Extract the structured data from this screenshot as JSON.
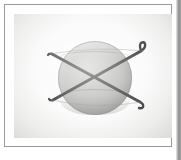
{
  "figure": {
    "title": "Sphere with crossed binding straps",
    "description": "Photographic plate showing a shaded gray sphere crossed by two dark straps forming an X, with hooked ends extending beyond the sphere.",
    "medium": "photographic plate in ruled frame"
  },
  "canvas": {
    "width": 181,
    "height": 160,
    "background_color": "#ffffff"
  },
  "frame": {
    "name": "ruled-border",
    "left": 4,
    "top": 4,
    "width": 168,
    "height": 143,
    "border_color": "#9a9a9c",
    "border_width": 1
  },
  "right_edge_strip": {
    "name": "page-gutter-shadow",
    "width": 5,
    "color_light": "#f2f2f2",
    "color_dark": "#8c8c8c"
  },
  "plate": {
    "name": "photo-plate",
    "left": 9,
    "top": 9,
    "width": 158,
    "height": 124,
    "background_center_color": "#fdfdfd",
    "background_edge_color": "#e4e4e2"
  },
  "sphere": {
    "name": "sphere",
    "center_x": 90,
    "center_y": 73,
    "radius": 37,
    "fill_highlight_color": "#c9c9c7",
    "fill_shadow_color": "#949492",
    "outline_color": "#787876",
    "latitude_arcs": [
      {
        "label": "upper-latitude-arc",
        "y_offset": 10
      },
      {
        "label": "lower-latitude-arc",
        "y_offset": 48
      }
    ]
  },
  "straps": {
    "color": "#2b2b2b",
    "width": 3.0,
    "items": [
      {
        "name": "strap-top-left-to-bottom-right",
        "start_x": 47,
        "start_y": 49,
        "end_x": 134,
        "end_y": 96,
        "hook_end": "bottom-right"
      },
      {
        "name": "strap-top-right-to-bottom-left",
        "start_x": 135,
        "start_y": 46,
        "end_x": 48,
        "end_y": 95,
        "hook_end": "top-right"
      }
    ],
    "crossing_point": {
      "x": 91,
      "y": 72
    }
  },
  "hooks": [
    {
      "name": "hook-top-left",
      "x": 47,
      "y": 49
    },
    {
      "name": "hook-top-right",
      "x": 136,
      "y": 45
    },
    {
      "name": "hook-bottom-left",
      "x": 48,
      "y": 95
    },
    {
      "name": "hook-bottom-right",
      "x": 134,
      "y": 96
    }
  ]
}
